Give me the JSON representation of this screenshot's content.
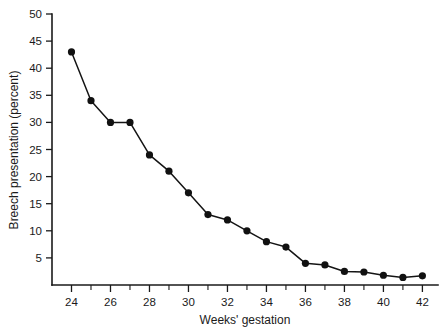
{
  "chart_data": {
    "type": "line",
    "title": "",
    "xlabel": "Weeks' gestation",
    "ylabel": "Breech presentation (percent)",
    "xlim": [
      23,
      42.8
    ],
    "ylim": [
      0,
      50
    ],
    "grid": false,
    "legend": "none",
    "marker": "filled-circle",
    "line_color": "#141414",
    "marker_color": "#111111",
    "x": [
      24,
      25,
      26,
      27,
      28,
      29,
      30,
      31,
      32,
      33,
      34,
      35,
      36,
      37,
      38,
      39,
      40,
      41,
      42
    ],
    "values": [
      43,
      34,
      30,
      30,
      24,
      21,
      17,
      13,
      12,
      10,
      8,
      7,
      4,
      3.7,
      2.5,
      2.4,
      1.8,
      1.4,
      1.7
    ],
    "series": [
      {
        "name": "Breech presentation",
        "values": [
          43,
          34,
          30,
          30,
          24,
          21,
          17,
          13,
          12,
          10,
          8,
          7,
          4,
          3.7,
          2.5,
          2.4,
          1.8,
          1.4,
          1.7
        ]
      }
    ],
    "x_ticks_major": [
      24,
      26,
      28,
      30,
      32,
      34,
      36,
      38,
      40,
      42
    ],
    "x_tick_labels": [
      "24",
      "26",
      "28",
      "30",
      "32",
      "34",
      "36",
      "38",
      "40",
      "42"
    ],
    "x_ticks_minor": [
      25,
      27,
      29,
      31,
      33,
      35,
      37,
      39,
      41
    ],
    "y_ticks": [
      5,
      10,
      15,
      20,
      25,
      30,
      35,
      40,
      45,
      50
    ],
    "y_tick_labels": [
      "5",
      "10",
      "15",
      "20",
      "25",
      "30",
      "35",
      "40",
      "45",
      "50"
    ]
  }
}
